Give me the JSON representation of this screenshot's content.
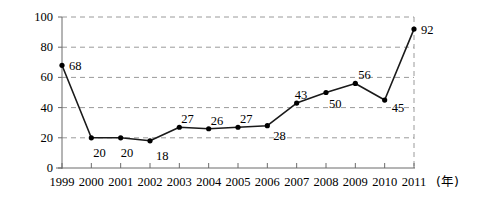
{
  "chart_data": {
    "type": "line",
    "title": "",
    "subtitle": "",
    "xlabel": "年",
    "ylabel": "",
    "categories": [
      "1999",
      "2000",
      "2001",
      "2002",
      "2003",
      "2004",
      "2005",
      "2006",
      "2007",
      "2008",
      "2009",
      "2010",
      "2011"
    ],
    "values": [
      68,
      20,
      20,
      18,
      27,
      26,
      27,
      28,
      43,
      50,
      56,
      45,
      92
    ],
    "point_labels": [
      "68",
      "20",
      "20",
      "18",
      "27",
      "26",
      "27",
      "28",
      "43",
      "50",
      "56",
      "45",
      "92"
    ],
    "label_offsets": [
      {
        "dx": 7,
        "dy": 1
      },
      {
        "dx": 2,
        "dy": 15
      },
      {
        "dx": 0,
        "dy": 15
      },
      {
        "dx": 6,
        "dy": 15
      },
      {
        "dx": 2,
        "dy": -8
      },
      {
        "dx": 2,
        "dy": -8
      },
      {
        "dx": 2,
        "dy": -8
      },
      {
        "dx": 6,
        "dy": 10
      },
      {
        "dx": -2,
        "dy": -8
      },
      {
        "dx": 3,
        "dy": 11
      },
      {
        "dx": 3,
        "dy": -8
      },
      {
        "dx": 7,
        "dy": 8
      },
      {
        "dx": 7,
        "dy": 1
      }
    ],
    "x": [
      1999,
      2000,
      2001,
      2002,
      2003,
      2004,
      2005,
      2006,
      2007,
      2008,
      2009,
      2010,
      2011
    ],
    "xlim": [
      1999,
      2011
    ],
    "ylim": [
      0,
      100
    ],
    "yticks": [
      0,
      20,
      40,
      60,
      80,
      100
    ],
    "ytick_labels": [
      "0",
      "20",
      "40",
      "60",
      "80",
      "100"
    ],
    "grid": true,
    "grid_style": "dashed",
    "grid_color": "#9a9a9a",
    "legend": null,
    "legend_position": "none",
    "line_color": "#1a1a1a",
    "marker": "circle",
    "marker_color": "#000000",
    "axis_color": "#6b6b6b",
    "annotations": []
  },
  "colors": {
    "background": "#ffffff",
    "ink": "#000000",
    "grid": "#9a9a9a",
    "axis": "#6b6b6b",
    "series": "#1a1a1a"
  }
}
